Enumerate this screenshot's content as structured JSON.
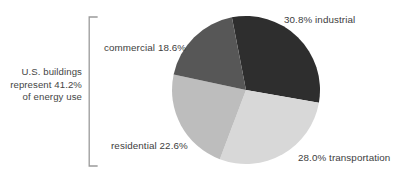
{
  "chart_data": {
    "type": "pie",
    "title": "",
    "subtitle": "",
    "xlabel": "",
    "ylabel": "",
    "legend_position": "none",
    "grid": false,
    "units": "percent",
    "total": 99.99999,
    "categories": [
      "industrial",
      "transportation",
      "residential",
      "commercial"
    ],
    "values": [
      30.8,
      28.0,
      22.6,
      18.6
    ],
    "slices": [
      {
        "name": "industrial",
        "value": 30.8,
        "label": "30.8% industrial",
        "color": "#2e2e2e",
        "start_angle_deg": -11.0,
        "end_angle_deg": 99.9,
        "label_side": "right"
      },
      {
        "name": "transportation",
        "value": 28.0,
        "label": "28.0% transportation",
        "color": "#d8d8d8",
        "start_angle_deg": 99.9,
        "end_angle_deg": 200.7,
        "label_side": "right"
      },
      {
        "name": "residential",
        "value": 22.6,
        "label": "residential 22.6%",
        "color": "#bdbdbd",
        "start_angle_deg": 200.7,
        "end_angle_deg": 282.1,
        "label_side": "left"
      },
      {
        "name": "commercial",
        "value": 18.6,
        "label": "commercial 18.6%",
        "color": "#575757",
        "start_angle_deg": 282.1,
        "end_angle_deg": 349.0,
        "label_side": "left"
      }
    ],
    "annotation": {
      "lines": [
        "U.S. buildings",
        "represent 41.2%",
        "of energy use"
      ],
      "value": 41.2,
      "covers": [
        "commercial",
        "residential"
      ],
      "bracket": "left-curly-bracket"
    }
  },
  "labels": {
    "industrial": "30.8% industrial",
    "commercial": "commercial 18.6%",
    "residential": "residential 22.6%",
    "transportation": "28.0% transportation"
  },
  "annotation": {
    "line1": "U.S. buildings",
    "line2": "represent 41.2%",
    "line3": "of energy use"
  },
  "colors": {
    "industrial": "#2e2e2e",
    "commercial": "#575757",
    "residential": "#bdbdbd",
    "transportation": "#d8d8d8",
    "text": "#3d3d3d",
    "bracket": "#9a9a9a",
    "background": "#ffffff"
  }
}
